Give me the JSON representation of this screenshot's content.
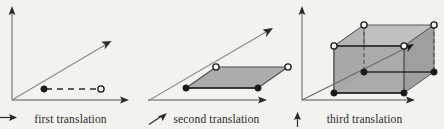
{
  "figure": {
    "background_color": "#f4f2ef",
    "ink_color": "#2a2a2a",
    "axis_color": "#8a8a8a",
    "fill_light": "#bdbdbd",
    "fill_mid": "#a6a6a6",
    "fill_dark": "#949494",
    "width": 444,
    "height": 129
  },
  "panels": [
    {
      "id": "first-translation",
      "caption": "first translation",
      "caption_arrow": "arrow-right",
      "arrow_icon_name": "arrow-right-icon",
      "axes": {
        "origin": [
          12,
          100
        ],
        "x_end": [
          128,
          100
        ],
        "y_end": [
          12,
          8
        ],
        "diagonal_end": [
          110,
          42
        ]
      },
      "vertices": [
        {
          "name": "origin-point",
          "x": 44,
          "y": 89,
          "style": "filled"
        },
        {
          "name": "translated-point",
          "x": 101,
          "y": 89,
          "style": "open"
        }
      ],
      "translation_segment": {
        "from": [
          44,
          89
        ],
        "to": [
          101,
          89
        ],
        "style": "dashed"
      }
    },
    {
      "id": "second-translation",
      "caption": "second translation",
      "caption_arrow": "arrow-up-right",
      "arrow_icon_name": "arrow-up-right-icon",
      "axes": {
        "origin": [
          -4,
          100
        ],
        "x_end": [
          116,
          100
        ],
        "diagonal_end": [
          124,
          40
        ]
      },
      "parallelogram": [
        {
          "name": "bottom-left-vertex",
          "x": 38,
          "y": 88,
          "style": "filled"
        },
        {
          "name": "bottom-right-vertex",
          "x": 110,
          "y": 88,
          "style": "filled"
        },
        {
          "name": "top-right-vertex",
          "x": 140,
          "y": 67,
          "style": "open"
        },
        {
          "name": "top-left-vertex",
          "x": 68,
          "y": 67,
          "style": "open"
        }
      ]
    },
    {
      "id": "third-translation",
      "caption": "third translation",
      "caption_arrow": "arrow-up",
      "arrow_icon_name": "arrow-up-icon",
      "axes": {
        "origin": [
          10,
          100
        ],
        "x_end": [
          122,
          100
        ],
        "y_end": [
          10,
          8
        ],
        "diagonal_end": [
          122,
          43
        ]
      },
      "prism_front": [
        {
          "name": "front-bottom-left-vertex",
          "x": 42,
          "y": 93,
          "style": "filled"
        },
        {
          "name": "front-bottom-right-vertex",
          "x": 112,
          "y": 93,
          "style": "filled"
        },
        {
          "name": "front-top-right-vertex",
          "x": 112,
          "y": 46,
          "style": "open"
        },
        {
          "name": "front-top-left-vertex",
          "x": 42,
          "y": 46,
          "style": "open"
        }
      ],
      "prism_back": [
        {
          "name": "back-bottom-left-vertex",
          "x": 72,
          "y": 72,
          "style": "filled"
        },
        {
          "name": "back-bottom-right-vertex",
          "x": 142,
          "y": 72,
          "style": "filled"
        },
        {
          "name": "back-top-right-vertex",
          "x": 142,
          "y": 25,
          "style": "open"
        },
        {
          "name": "back-top-left-vertex",
          "x": 72,
          "y": 25,
          "style": "open"
        }
      ]
    }
  ]
}
